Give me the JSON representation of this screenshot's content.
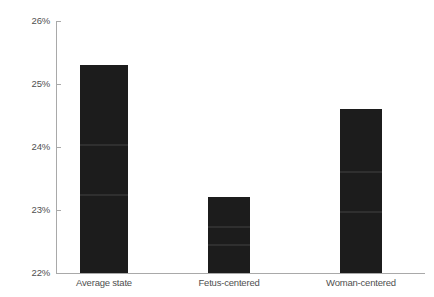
{
  "chart_data": {
    "type": "bar",
    "title": "",
    "subtitle": "",
    "xlabel": "",
    "ylabel": "",
    "categories": [
      "Average state",
      "Fetus-centered",
      "Woman-centered"
    ],
    "values": [
      25.3,
      23.2,
      24.6
    ],
    "value_labels": [
      "25.3%",
      "23.2%",
      "24.6%"
    ],
    "ylim": [
      22,
      26
    ],
    "y_ticks": [
      22,
      23,
      24,
      25,
      26
    ],
    "y_tick_labels": [
      "22%",
      "23%",
      "24%",
      "25%",
      "26%"
    ],
    "grid": false,
    "legend": null,
    "legend_position": "none",
    "bar_color": "#1c1c1c",
    "axis_color": "#a9a9a9",
    "text_color": "#4f4f4f",
    "background_color": "#ffffff",
    "annotations": []
  },
  "axis": {
    "y_labels": [
      "26%",
      "25%",
      "24%",
      "23%",
      "22%"
    ],
    "x_labels": [
      "Average state",
      "Fetus-centered",
      "Woman-centered"
    ]
  },
  "bars": [
    {
      "label": "Average state",
      "value": 25.3
    },
    {
      "label": "Fetus-centered",
      "value": 23.2
    },
    {
      "label": "Woman-centered",
      "value": 24.6
    }
  ]
}
